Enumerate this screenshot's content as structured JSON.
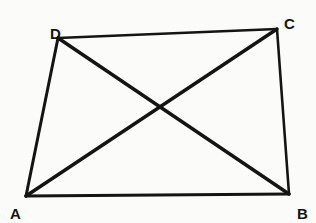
{
  "figure": {
    "background_color": "#fbfbf9",
    "stroke_color": "#141414",
    "canvas": {
      "width": 316,
      "height": 223
    },
    "vertices": [
      {
        "id": "A",
        "label": "A",
        "x": 26,
        "y": 196,
        "label_x": 10,
        "label_y": 206
      },
      {
        "id": "B",
        "label": "B",
        "x": 289,
        "y": 194,
        "label_x": 297,
        "label_y": 206
      },
      {
        "id": "C",
        "label": "C",
        "x": 277,
        "y": 29,
        "label_x": 284,
        "label_y": 16
      },
      {
        "id": "D",
        "label": "D",
        "x": 58,
        "y": 38,
        "label_x": 50,
        "label_y": 26
      }
    ],
    "edges": [
      {
        "name": "side-AB",
        "from": "A",
        "to": "B",
        "stroke_width": 3.2,
        "kind": "side"
      },
      {
        "name": "side-BC",
        "from": "B",
        "to": "C",
        "stroke_width": 2.6,
        "kind": "side"
      },
      {
        "name": "side-CD",
        "from": "C",
        "to": "D",
        "stroke_width": 2.6,
        "kind": "side"
      },
      {
        "name": "side-DA",
        "from": "D",
        "to": "A",
        "stroke_width": 3.0,
        "kind": "side"
      },
      {
        "name": "diagonal-AC",
        "from": "A",
        "to": "C",
        "stroke_width": 3.4,
        "kind": "diagonal"
      },
      {
        "name": "diagonal-DB",
        "from": "D",
        "to": "B",
        "stroke_width": 3.4,
        "kind": "diagonal"
      }
    ],
    "intersection": {
      "name": "diagonals-intersection",
      "x": 160,
      "y": 108
    }
  }
}
